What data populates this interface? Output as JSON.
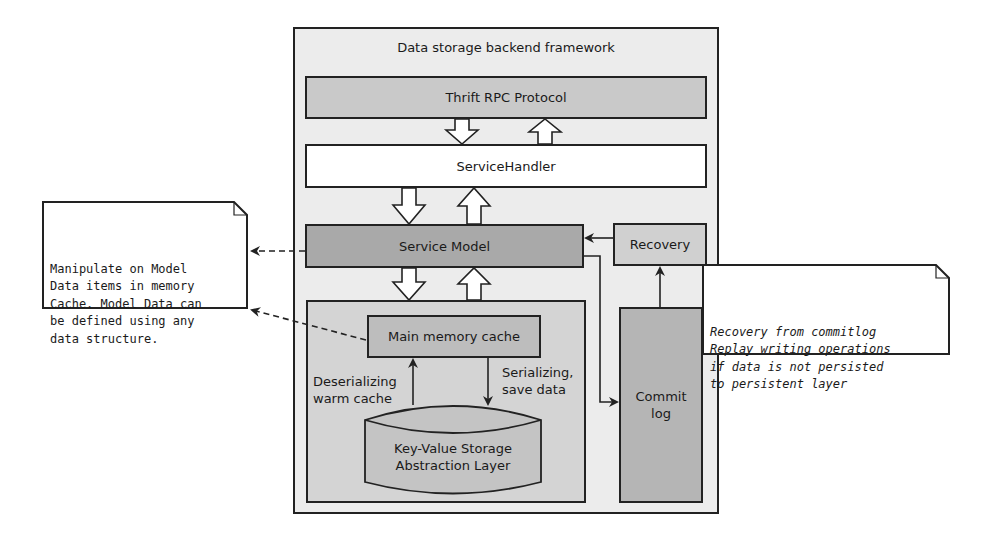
{
  "diagram": {
    "framework_title": "Data storage backend framework",
    "components": {
      "thrift": "Thrift RPC Protocol",
      "service_handler": "ServiceHandler",
      "service_model": "Service Model",
      "recovery": "Recovery",
      "main_memory_cache": "Main memory cache",
      "key_value_storage": [
        "Key-Value Storage",
        "Abstraction Layer"
      ],
      "commit_log": [
        "Commit",
        "log"
      ]
    },
    "edge_labels": {
      "deserializing": [
        "Deserializing",
        "warm cache"
      ],
      "serializing": [
        "Serializing,",
        "save data"
      ]
    },
    "notes": {
      "left": [
        "Manipulate on Model",
        "Data items in memory",
        "Cache. Model Data can",
        "be defined using any",
        "data structure."
      ],
      "right": [
        "Recovery from commitlog",
        "Replay writing operations",
        "if data is not persisted",
        "to persistent layer"
      ]
    },
    "colors": {
      "framework_bg": "#ececec",
      "thrift_bg": "#c9c9c9",
      "handler_bg": "#ffffff",
      "service_model_bg": "#a9a9a9",
      "recovery_bg": "#d0d0d0",
      "lower_container_bg": "#d4d4d4",
      "cache_bg": "#bdbdbd",
      "commit_log_bg": "#b5b5b5",
      "storage_bg": "#c4c4c4",
      "stroke": "#222222"
    }
  }
}
